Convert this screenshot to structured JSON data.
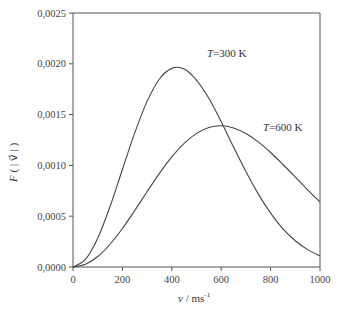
{
  "chart_data": {
    "type": "line",
    "title": "",
    "xlabel": "v / ms⁻¹",
    "ylabel": "F ( |v⃗| )",
    "xlim": [
      0,
      1000
    ],
    "ylim": [
      0,
      0.0025
    ],
    "x_ticks": [
      "0",
      "200",
      "400",
      "600",
      "800",
      "1000"
    ],
    "y_ticks": [
      "0,0000",
      "0,0005",
      "0,0010",
      "0,0015",
      "0,0020",
      "0,0025"
    ],
    "grid": false,
    "x": [
      0,
      50,
      100,
      150,
      200,
      250,
      300,
      350,
      400,
      450,
      500,
      550,
      600,
      650,
      700,
      750,
      800,
      850,
      900,
      950,
      1000
    ],
    "series": [
      {
        "name": "T=300 K",
        "values": [
          0,
          7.4e-05,
          0.000284,
          0.000596,
          0.00096,
          0.00132,
          0.00163,
          0.00185,
          0.001955,
          0.00195,
          0.00184,
          0.00166,
          0.00143,
          0.00118,
          0.00094,
          0.00072,
          0.00053,
          0.000375,
          0.000258,
          0.000171,
          0.000109
        ]
      },
      {
        "name": "T=600 K",
        "values": [
          0,
          2.65e-05,
          0.000103,
          0.000224,
          0.000379,
          0.000556,
          0.000741,
          0.000921,
          0.001083,
          0.001217,
          0.001315,
          0.001373,
          0.00139,
          0.001369,
          0.001314,
          0.001231,
          0.001127,
          0.001009,
          0.000885,
          0.00076,
          0.000641
        ]
      }
    ],
    "annotations": [
      {
        "text": "T=300 K",
        "x": 520,
        "y": 0.00201
      },
      {
        "text": "T=600 K",
        "x": 780,
        "y": 0.00138
      }
    ]
  },
  "labels": {
    "curve1_T": "T",
    "curve1_rest": "=300 K",
    "curve2_T": "T",
    "curve2_rest": "=600 K",
    "xlabel_v": "v",
    "xlabel_unit": " / ms",
    "xlabel_exp": "-1",
    "ylabel_F": "F",
    "ylabel_arg": " ( | v⃗ | )"
  }
}
